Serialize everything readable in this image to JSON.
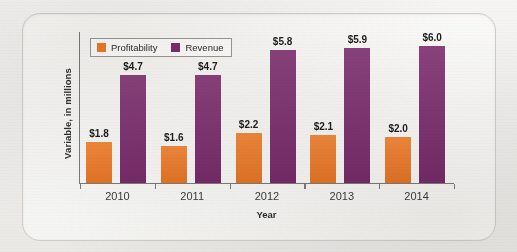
{
  "figure": {
    "frame_label": "chart-frame"
  },
  "legend": {
    "position": "top-left-inside",
    "items": [
      {
        "label": "Profitability",
        "color": "#f07b27",
        "swatch_name": "legend-swatch-profitability"
      },
      {
        "label": "Revenue",
        "color": "#7d2d6e",
        "swatch_name": "legend-swatch-revenue"
      }
    ]
  },
  "axes": {
    "x_title": "Year",
    "y_title": "Variable, in millions"
  },
  "chart_data": {
    "type": "bar",
    "title": "",
    "subtitle": "",
    "xlabel": "Year",
    "ylabel": "Variable, in millions",
    "categories": [
      "2010",
      "2011",
      "2012",
      "2013",
      "2014"
    ],
    "series": [
      {
        "name": "Profitability",
        "color": "#f07b27",
        "values": [
          1.8,
          1.6,
          2.2,
          2.1,
          2.0
        ],
        "labels": [
          "$1.8",
          "$1.6",
          "$2.2",
          "$2.1",
          "$2.0"
        ]
      },
      {
        "name": "Revenue",
        "color": "#7d2d6e",
        "values": [
          4.7,
          4.7,
          5.8,
          5.9,
          6.0
        ],
        "labels": [
          "$4.7",
          "$4.7",
          "$5.8",
          "$5.9",
          "$6.0"
        ]
      }
    ],
    "ylim": [
      0,
      6.6
    ],
    "grid": false,
    "legend_position": "upper left",
    "y_tick_labels": [],
    "x_tick_labels": [
      "2010",
      "2011",
      "2012",
      "2013",
      "2014"
    ]
  }
}
